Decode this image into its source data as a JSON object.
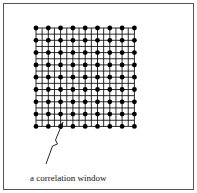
{
  "diagram": {
    "caption": "a correlation window",
    "grid": {
      "dot_columns": 9,
      "dot_rows": 9,
      "x0": 36,
      "y0": 28,
      "spacing": 12.3,
      "subdivisions": 2,
      "line_color": "#111111",
      "dot_color": "#000000"
    },
    "arrow": {
      "from": [
        46,
        164
      ],
      "to": [
        63,
        122
      ]
    }
  }
}
